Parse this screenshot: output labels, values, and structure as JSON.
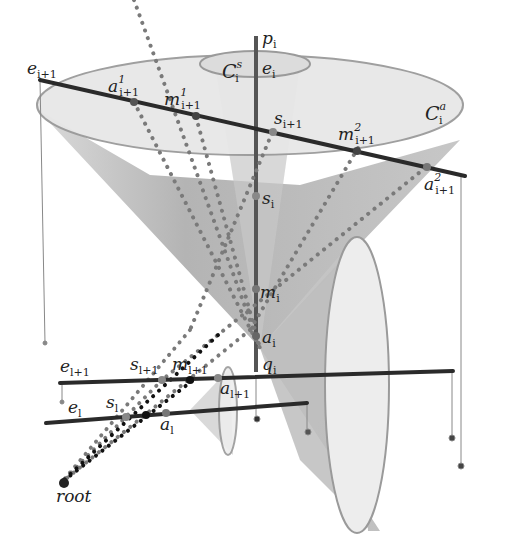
{
  "colors": {
    "background": "#ffffff",
    "cone_fill": "#b4b4b4",
    "disk_fill": "#e6e6e6",
    "disk_stroke": "#9a9a9a",
    "axis_line": "#555555",
    "edge_line": "#2a2a2a",
    "grey_dots": "#7a7a7a",
    "black_dots": "#111111",
    "text": "#222222"
  },
  "labels": {
    "p_i": {
      "base": "p",
      "sub": "i",
      "sup": ""
    },
    "e_i": {
      "base": "e",
      "sub": "i",
      "sup": ""
    },
    "C_s_i": {
      "base": "C",
      "sub": "i",
      "sup": "s"
    },
    "C_a_i": {
      "base": "C",
      "sub": "i",
      "sup": "a"
    },
    "e_i1": {
      "base": "e",
      "sub": "i+1",
      "sup": ""
    },
    "a1_i1": {
      "base": "a",
      "sub": "i+1",
      "sup": "1"
    },
    "m1_i1": {
      "base": "m",
      "sub": "i+1",
      "sup": "1"
    },
    "s_i1": {
      "base": "s",
      "sub": "i+1",
      "sup": ""
    },
    "m2_i1": {
      "base": "m",
      "sub": "i+1",
      "sup": "2"
    },
    "a2_i1": {
      "base": "a",
      "sub": "i+1",
      "sup": "2"
    },
    "s_i": {
      "base": "s",
      "sub": "i",
      "sup": ""
    },
    "m_i": {
      "base": "m",
      "sub": "i",
      "sup": ""
    },
    "a_i": {
      "base": "a",
      "sub": "i",
      "sup": ""
    },
    "q_i": {
      "base": "q",
      "sub": "i",
      "sup": ""
    },
    "e_l1": {
      "base": "e",
      "sub": "l+1",
      "sup": ""
    },
    "s_l1": {
      "base": "s",
      "sub": "l+1",
      "sup": ""
    },
    "m_l1": {
      "base": "m",
      "sub": "l+1",
      "sup": ""
    },
    "a_l1": {
      "base": "a",
      "sub": "l+1",
      "sup": ""
    },
    "e_l": {
      "base": "e",
      "sub": "l",
      "sup": ""
    },
    "s_l": {
      "base": "s",
      "sub": "l",
      "sup": ""
    },
    "a_l": {
      "base": "a",
      "sub": "l",
      "sup": ""
    },
    "root": {
      "base": "root",
      "sub": "",
      "sup": ""
    }
  }
}
